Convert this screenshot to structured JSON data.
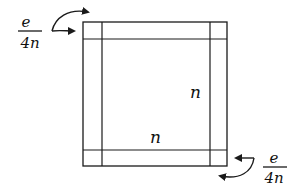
{
  "diagram": {
    "colors": {
      "stroke": "#1a1a1a",
      "background": "#ffffff"
    },
    "square": {
      "outer": {
        "x": 83,
        "y": 22,
        "w": 144,
        "h": 144
      },
      "inner_lines": {
        "left": 102,
        "right": 210,
        "top": 39,
        "bottom": 150
      }
    },
    "labels": {
      "side_right": "n",
      "side_bottom": "n",
      "top_left_fraction": {
        "numerator": "e",
        "denominator": "4n"
      },
      "bottom_right_fraction": {
        "numerator": "e",
        "denominator": "4n"
      }
    },
    "arrows": [
      {
        "name": "top-left-curved-arrow",
        "points_to": "top strip corner"
      },
      {
        "name": "top-left-straight-arrow",
        "points_to": "left strip corner"
      },
      {
        "name": "bottom-right-straight-arrow",
        "points_to": "right strip corner"
      },
      {
        "name": "bottom-right-curved-arrow",
        "points_to": "bottom strip corner"
      }
    ]
  }
}
